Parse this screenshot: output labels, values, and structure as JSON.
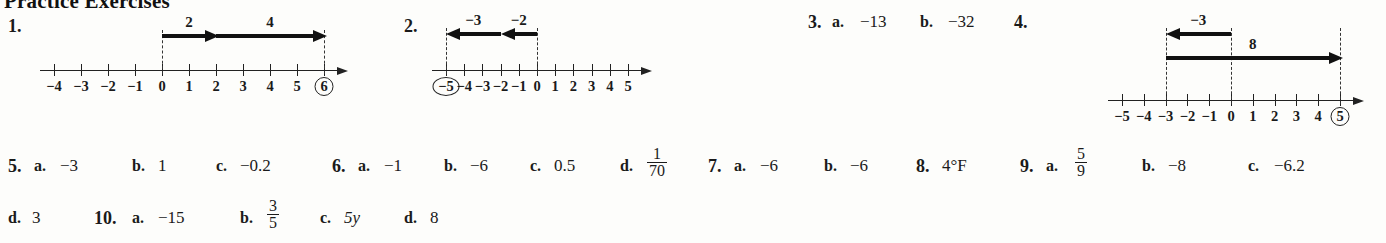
{
  "heading": "Practice Exercises",
  "exercises": {
    "e1": {
      "number": "1."
    },
    "e2": {
      "number": "2."
    },
    "e3": {
      "number": "3.",
      "parts": [
        {
          "letter": "a.",
          "value": "−13"
        },
        {
          "letter": "b.",
          "value": "−32"
        }
      ]
    },
    "e4": {
      "number": "4."
    },
    "e5": {
      "number": "5.",
      "parts": [
        {
          "letter": "a.",
          "value": "−3"
        },
        {
          "letter": "b.",
          "value": "1"
        },
        {
          "letter": "c.",
          "value": "−0.2"
        }
      ]
    },
    "e6": {
      "number": "6.",
      "parts": [
        {
          "letter": "a.",
          "value": "−1"
        },
        {
          "letter": "b.",
          "value": "−6"
        },
        {
          "letter": "c.",
          "value": "0.5"
        },
        {
          "letter": "d.",
          "value": "",
          "fraction": {
            "numerator": "1",
            "denominator": "70"
          }
        }
      ]
    },
    "e7": {
      "number": "7.",
      "parts": [
        {
          "letter": "a.",
          "value": "−6"
        },
        {
          "letter": "b.",
          "value": "−6"
        }
      ]
    },
    "e8": {
      "number": "8.",
      "value": "4°F"
    },
    "e9": {
      "number": "9.",
      "parts": [
        {
          "letter": "a.",
          "value": "",
          "fraction": {
            "numerator": "5",
            "denominator": "9"
          }
        },
        {
          "letter": "b.",
          "value": "−8"
        },
        {
          "letter": "c.",
          "value": "−6.2"
        },
        {
          "letter": "d.",
          "value": "3"
        }
      ]
    },
    "e10": {
      "number": "10.",
      "parts": [
        {
          "letter": "a.",
          "value": "−15"
        },
        {
          "letter": "b.",
          "value": "",
          "fraction": {
            "numerator": "3",
            "denominator": "5"
          }
        },
        {
          "letter": "c.",
          "value": "5y"
        },
        {
          "letter": "d.",
          "value": "8"
        }
      ]
    }
  },
  "numberlines": {
    "nl1": {
      "min": -4,
      "max": 6,
      "ticks": [
        "−4",
        "−3",
        "−2",
        "−1",
        "0",
        "1",
        "2",
        "3",
        "4",
        "5",
        "6"
      ],
      "circled": "6",
      "vectors": [
        {
          "label": "2",
          "from": 0,
          "to": 2,
          "direction": "right"
        },
        {
          "label": "4",
          "from": 2,
          "to": 6,
          "direction": "right"
        }
      ],
      "dashes": [
        0,
        6
      ]
    },
    "nl2": {
      "min": -5,
      "max": 5,
      "ticks": [
        "−5",
        "−4",
        "−3",
        "−2",
        "−1",
        "0",
        "1",
        "2",
        "3",
        "4",
        "5"
      ],
      "circled": "−5",
      "vectors": [
        {
          "label": "−2",
          "from": 0,
          "to": -2,
          "direction": "left"
        },
        {
          "label": "−3",
          "from": -2,
          "to": -5,
          "direction": "left"
        }
      ],
      "dashes": [
        0,
        -5
      ]
    },
    "nl4": {
      "min": -5,
      "max": 5,
      "ticks": [
        "−5",
        "−4",
        "−3",
        "−2",
        "−1",
        "0",
        "1",
        "2",
        "3",
        "4",
        "5"
      ],
      "circled": "5",
      "vectors": [
        {
          "label": "−3",
          "from": 0,
          "to": -3,
          "direction": "left"
        },
        {
          "label": "8",
          "from": -3,
          "to": 5,
          "direction": "right"
        }
      ],
      "dashes": [
        0,
        -3,
        5
      ]
    }
  }
}
